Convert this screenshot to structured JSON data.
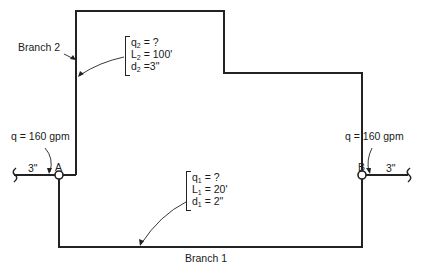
{
  "diagram": {
    "type": "parallel-pipe-network",
    "branch2": {
      "label": "Branch 2",
      "q_var": "q",
      "q_sub": "2",
      "q_val": " = ?",
      "L_var": "L",
      "L_sub": "2",
      "L_val": " = 100'",
      "d_var": "d",
      "d_sub": "2",
      "d_val": " =3\""
    },
    "branch1": {
      "label": "Branch 1",
      "q_var": "q",
      "q_sub": "1",
      "q_val": " = ?",
      "L_var": "L",
      "L_sub": "1",
      "L_val": " = 20'",
      "d_var": "d",
      "d_sub": "1",
      "d_val": " = 2\""
    },
    "inflow": {
      "label": "q = 160 gpm",
      "pipe_size": "3\""
    },
    "outflow": {
      "label": "q = 160 gpm",
      "pipe_size": "3\""
    },
    "nodes": {
      "a": "A",
      "b": "B"
    },
    "colors": {
      "line": "#222222",
      "background": "#ffffff"
    }
  }
}
